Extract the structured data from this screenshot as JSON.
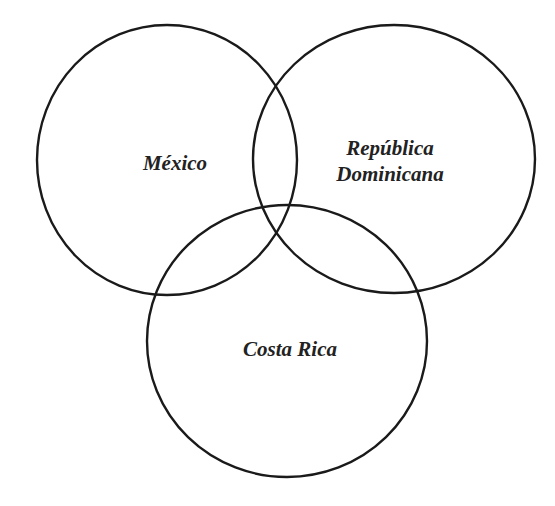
{
  "diagram": {
    "type": "venn",
    "stroke_color": "#1a1a1a",
    "background": "#ffffff",
    "sets": [
      {
        "id": "mexico",
        "label": "México",
        "cx": 167,
        "cy": 160,
        "rx": 130,
        "ry": 135
      },
      {
        "id": "republica-dominicana",
        "label_line1": "República",
        "label_line2": "Dominicana",
        "cx": 394,
        "cy": 159,
        "rx": 141,
        "ry": 134
      },
      {
        "id": "costa-rica",
        "label": "Costa Rica",
        "cx": 287,
        "cy": 341,
        "rx": 140,
        "ry": 136
      }
    ]
  }
}
